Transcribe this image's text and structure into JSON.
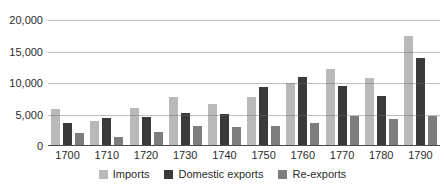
{
  "chart_data": {
    "type": "bar",
    "title": "",
    "xlabel": "",
    "ylabel": "",
    "categories": [
      "1700",
      "1710",
      "1720",
      "1730",
      "1740",
      "1750",
      "1760",
      "1770",
      "1780",
      "1790"
    ],
    "series": [
      {
        "name": "Imports",
        "color": "#b9b9b9",
        "values": [
          5900,
          4000,
          6100,
          7800,
          6700,
          7700,
          10000,
          12200,
          10800,
          17500
        ]
      },
      {
        "name": "Domestic exports",
        "color": "#3a3a3a",
        "values": [
          3700,
          4400,
          4600,
          5300,
          5000,
          9400,
          10900,
          9500,
          8000,
          13900
        ]
      },
      {
        "name": "Re-exports",
        "color": "#7d7d7d",
        "values": [
          2100,
          1500,
          2200,
          3100,
          3000,
          3200,
          3700,
          4800,
          4300,
          4700
        ]
      }
    ],
    "ylim": [
      0,
      20000
    ],
    "yticks": [
      {
        "value": 20000,
        "label": "20,000"
      },
      {
        "value": 15000,
        "label": "15,000"
      },
      {
        "value": 10000,
        "label": "10,000"
      },
      {
        "value": 5000,
        "label": "5,000"
      },
      {
        "value": 0,
        "label": "0"
      }
    ],
    "grid": true,
    "legend_position": "bottom"
  },
  "colors": {
    "background": "#ffffff",
    "gridline": "#6e6e6e",
    "axis_line": "#4a4a4a",
    "text": "#2b2b2b"
  }
}
